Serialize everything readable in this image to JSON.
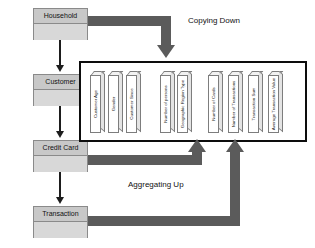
{
  "diagram": {
    "entities": [
      {
        "name": "Household"
      },
      {
        "name": "Customer"
      },
      {
        "name": "Credit Card"
      },
      {
        "name": "Transaction"
      }
    ],
    "flows": [
      {
        "label": "Copying Down"
      },
      {
        "label": "Aggregating Up"
      }
    ],
    "columns": [
      {
        "label": "Customer Age"
      },
      {
        "label": "Gender"
      },
      {
        "label": "Customer Since"
      },
      {
        "label": "Number of persons"
      },
      {
        "label": "Geographic Region Type"
      },
      {
        "label": "Number of Cards"
      },
      {
        "label": "Number of Transactions"
      },
      {
        "label": "Transaction Sum"
      },
      {
        "label": "Average Transaction Value"
      }
    ],
    "colors": {
      "entity_fill": "#d2d2d2",
      "entity_border": "#8a8a8a",
      "flow_arrow": "#5b5b5b",
      "connector": "#1d1d1d",
      "container_border": "#0d0d0d",
      "column_face": "#ffffff",
      "column_border": "#7d7d7d"
    }
  }
}
